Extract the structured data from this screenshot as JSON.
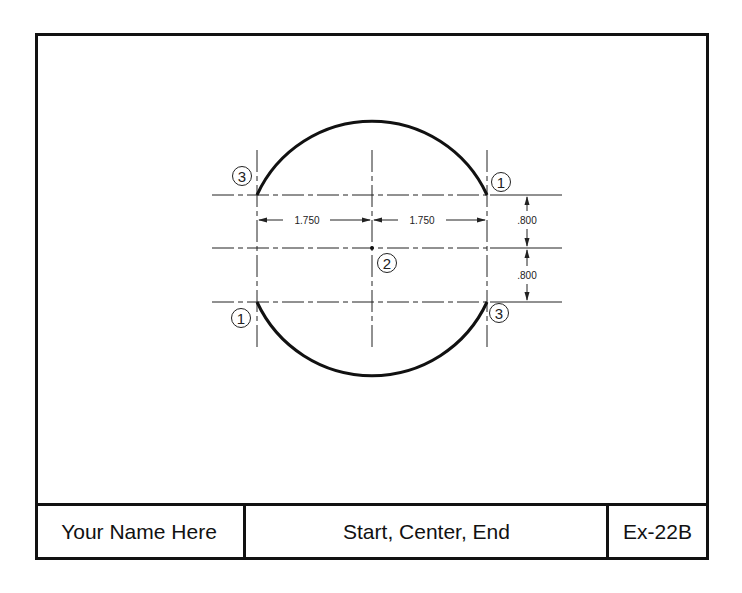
{
  "drawing": {
    "exercise": "Ex-22B",
    "method": "Start, Center, End",
    "author": "Your Name Here"
  },
  "title_block": {
    "name_label": "Your Name Here",
    "title_label": "Start, Center, End",
    "number_label": "Ex-22B"
  },
  "dimensions": {
    "horizontal_left": "1.750",
    "horizontal_right": "1.750",
    "vertical_top": ".800",
    "vertical_bottom": ".800"
  },
  "point_labels": {
    "top_left": "3",
    "top_right": "1",
    "center": "2",
    "bottom_left": "1",
    "bottom_right": "3"
  },
  "colors": {
    "line": "#111111",
    "background": "#ffffff"
  }
}
